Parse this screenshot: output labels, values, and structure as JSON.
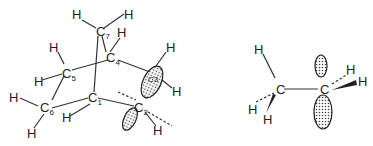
{
  "left_molecule": {
    "name": "norbornyl-type bicyclic structure",
    "atoms": [
      {
        "id": "C1",
        "label": "C",
        "sub": "1"
      },
      {
        "id": "C2",
        "label": "C",
        "sub": "2"
      },
      {
        "id": "C3",
        "label": "C",
        "sub": "3"
      },
      {
        "id": "C4",
        "label": "C",
        "sub": "4"
      },
      {
        "id": "C5",
        "label": "C",
        "sub": "5"
      },
      {
        "id": "C6",
        "label": "C",
        "sub": "6"
      },
      {
        "id": "C7",
        "label": "C",
        "sub": "7"
      }
    ],
    "hydrogen_label": "H"
  },
  "right_molecule": {
    "name": "ethyl radical / ethylene-like fragment",
    "carbon_label": "C",
    "hydrogen_label": "H"
  }
}
